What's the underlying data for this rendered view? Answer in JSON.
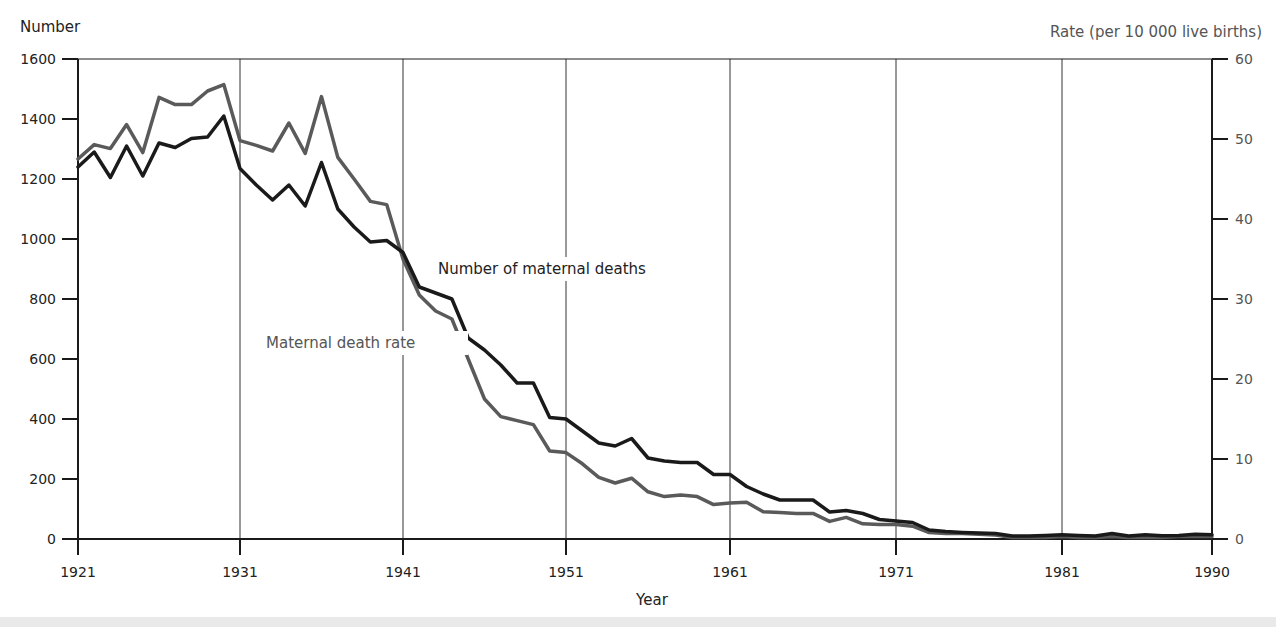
{
  "chart_data": {
    "type": "line",
    "title": "",
    "xlabel": "Year",
    "ylabel": "Number",
    "ylabel_right": "Rate (per 10 000 live births)",
    "xlim": [
      1921,
      1990
    ],
    "ylim": [
      0,
      1600
    ],
    "ylim_right": [
      0,
      60
    ],
    "x_ticks": [
      1921,
      1931,
      1941,
      1951,
      1961,
      1971,
      1981,
      1990
    ],
    "y_ticks": [
      0,
      200,
      400,
      600,
      800,
      1000,
      1200,
      1400,
      1600
    ],
    "y_ticks_right": [
      0,
      10,
      20,
      30,
      40,
      50,
      60
    ],
    "grid": "vertical lines at decade ticks",
    "legend": "inline annotations",
    "x": [
      1921,
      1922,
      1923,
      1924,
      1925,
      1926,
      1927,
      1928,
      1929,
      1930,
      1931,
      1932,
      1933,
      1934,
      1935,
      1936,
      1937,
      1938,
      1939,
      1940,
      1941,
      1942,
      1943,
      1944,
      1945,
      1946,
      1947,
      1948,
      1949,
      1950,
      1951,
      1952,
      1953,
      1954,
      1955,
      1956,
      1957,
      1958,
      1959,
      1960,
      1961,
      1962,
      1963,
      1964,
      1965,
      1966,
      1967,
      1968,
      1969,
      1970,
      1971,
      1972,
      1973,
      1974,
      1975,
      1976,
      1977,
      1978,
      1979,
      1980,
      1981,
      1982,
      1983,
      1984,
      1985,
      1986,
      1987,
      1988,
      1989,
      1990
    ],
    "series": [
      {
        "name": "Number of maternal deaths",
        "axis": "left",
        "color": "#1a1a1a",
        "values": [
          1240,
          1290,
          1205,
          1310,
          1210,
          1320,
          1305,
          1335,
          1340,
          1410,
          1235,
          1180,
          1130,
          1180,
          1110,
          1255,
          1100,
          1040,
          990,
          995,
          955,
          840,
          820,
          800,
          670,
          630,
          580,
          520,
          520,
          405,
          400,
          360,
          320,
          310,
          335,
          270,
          260,
          255,
          255,
          215,
          215,
          175,
          150,
          130,
          130,
          130,
          90,
          95,
          85,
          65,
          60,
          55,
          30,
          25,
          22,
          20,
          18,
          10,
          10,
          12,
          14,
          12,
          10,
          18,
          10,
          14,
          11,
          12,
          16,
          14
        ]
      },
      {
        "name": "Maternal death rate",
        "axis": "right",
        "color": "#5a5a5a",
        "values": [
          47.5,
          49.3,
          48.8,
          51.8,
          48.3,
          55.2,
          54.3,
          54.3,
          56,
          56.8,
          49.8,
          49.2,
          48.5,
          52,
          48.2,
          55.3,
          47.7,
          45,
          42.2,
          41.8,
          35,
          30.5,
          28.5,
          27.5,
          22.5,
          17.5,
          15.3,
          14.8,
          14.3,
          11,
          10.8,
          9.4,
          7.7,
          7,
          7.6,
          5.9,
          5.3,
          5.5,
          5.3,
          4.3,
          4.5,
          4.6,
          3.4,
          3.3,
          3.2,
          3.2,
          2.2,
          2.7,
          1.9,
          1.8,
          1.8,
          1.6,
          0.8,
          0.7,
          0.7,
          0.6,
          0.5,
          0.2,
          0.2,
          0.2,
          0.3,
          0.2,
          0.2,
          0.3,
          0.2,
          0.2,
          0.2,
          0.3,
          0.3,
          0.3
        ]
      }
    ],
    "annotations": [
      {
        "text": "Number of maternal deaths",
        "x": 1944,
        "y": 900
      },
      {
        "text": "Maternal death rate",
        "x": 1933,
        "y": 650
      }
    ]
  },
  "labels": {
    "y_left": "Number",
    "y_right": "Rate (per 10 000 live births)",
    "x_axis": "Year",
    "annot_number": "Number of maternal deaths",
    "annot_rate": "Maternal death rate"
  },
  "colors": {
    "number_line": "#1a1a1a",
    "rate_line": "#5a5a5a",
    "axis": "#1a1a1a",
    "grid": "#333333"
  }
}
